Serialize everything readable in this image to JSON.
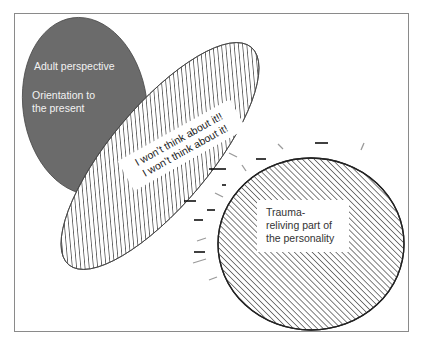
{
  "diagram": {
    "adult_part": {
      "line1": "Adult perspective",
      "line2a": "Orientation to",
      "line2b": "the present",
      "fill_color": "#6b6b6b"
    },
    "avoidance_part": {
      "line1": "I won’t think about it!!",
      "line2": "I won’t think about it!",
      "pattern": "diagonal-hatch-backslash"
    },
    "trauma_part": {
      "line1": "Trauma-",
      "line2": "reliving part of",
      "line3": "the personality",
      "pattern": "diagonal-hatch-slash"
    },
    "colors": {
      "frame": "#8a8a8a",
      "hatch": "#555555",
      "outline": "#333333"
    }
  }
}
